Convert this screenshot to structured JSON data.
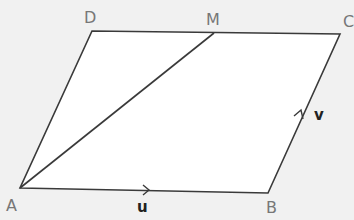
{
  "diagram": {
    "type": "parallelogram",
    "vertices": {
      "A": {
        "label": "A",
        "x": 20,
        "y": 188
      },
      "B": {
        "label": "B",
        "x": 268,
        "y": 193
      },
      "C": {
        "label": "C",
        "x": 340,
        "y": 34
      },
      "D": {
        "label": "D",
        "x": 92,
        "y": 31
      },
      "M": {
        "label": "M",
        "x": 214,
        "y": 33
      }
    },
    "segments": [
      "AB",
      "BC",
      "CD",
      "DA",
      "AM"
    ],
    "vectors": {
      "u": {
        "label": "u",
        "along": "AB"
      },
      "v": {
        "label": "v",
        "along": "BC"
      }
    },
    "colors": {
      "line": "#3a3a3a",
      "fill": "#ffffff",
      "background": "#f1f1f1",
      "label": "#777777"
    }
  }
}
